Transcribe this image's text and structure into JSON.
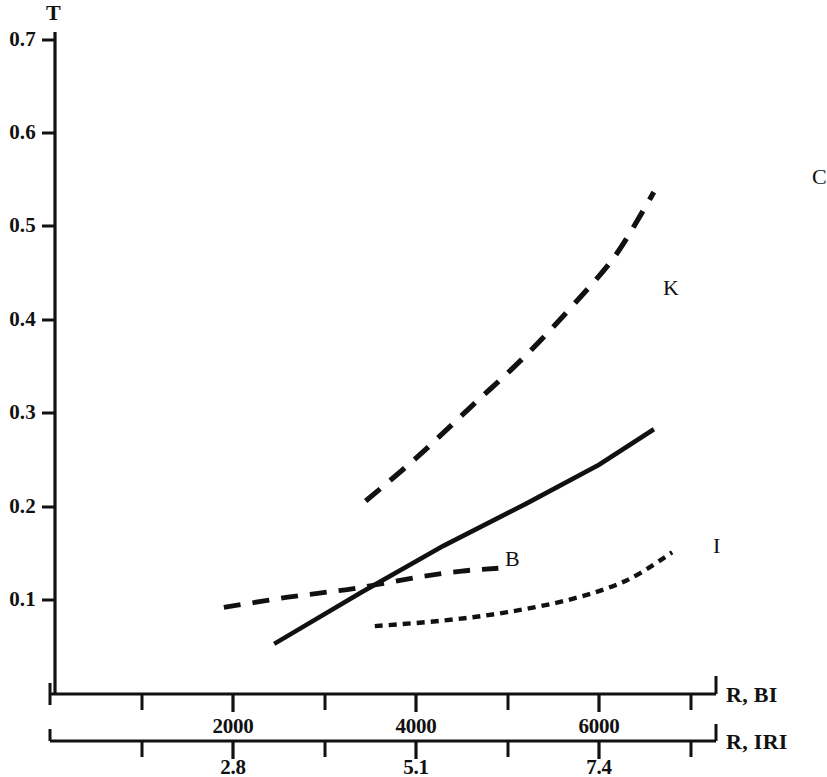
{
  "chart_data": {
    "type": "line",
    "title": "",
    "ylabel": "T",
    "ylim": [
      0,
      0.7
    ],
    "yticks": [
      0.1,
      0.2,
      0.3,
      0.4,
      0.5,
      0.6,
      0.7
    ],
    "ytick_labels": [
      "0.1",
      "0.2",
      "0.3",
      "0.4",
      "0.5",
      "0.6",
      "0.7"
    ],
    "grid": false,
    "legend": "inline-end-labels",
    "axes": [
      {
        "name": "primary-x-axis",
        "label": "R, BI",
        "ticks": [
          2000,
          4000,
          6000
        ],
        "tick_labels": [
          "2000",
          "4000",
          "6000"
        ],
        "minor_ticks": [
          1000,
          3000,
          5000,
          7000
        ],
        "xlim": [
          0,
          7600
        ]
      },
      {
        "name": "secondary-x-axis",
        "label": "R, IRI",
        "ticks": [
          2.8,
          5.1,
          7.4
        ],
        "tick_labels": [
          "2.8",
          "5.1",
          "7.4"
        ],
        "minor_ticks": [
          1.65,
          3.95,
          6.25,
          8.55
        ],
        "xlim": [
          0,
          8.9
        ]
      }
    ],
    "series": [
      {
        "name": "C",
        "label": "C",
        "style": "dashed",
        "points": [
          {
            "x": 3450,
            "y": 0.206
          },
          {
            "x": 4000,
            "y": 0.252
          },
          {
            "x": 4600,
            "y": 0.307
          },
          {
            "x": 5200,
            "y": 0.362
          },
          {
            "x": 5800,
            "y": 0.425
          },
          {
            "x": 6200,
            "y": 0.472
          },
          {
            "x": 6600,
            "y": 0.537
          }
        ]
      },
      {
        "name": "K",
        "label": "K",
        "style": "solid",
        "points": [
          {
            "x": 2450,
            "y": 0.053
          },
          {
            "x": 3400,
            "y": 0.108
          },
          {
            "x": 4300,
            "y": 0.158
          },
          {
            "x": 5200,
            "y": 0.203
          },
          {
            "x": 6000,
            "y": 0.245
          },
          {
            "x": 6600,
            "y": 0.283
          }
        ]
      },
      {
        "name": "B",
        "label": "B",
        "style": "dashed",
        "points": [
          {
            "x": 1900,
            "y": 0.092
          },
          {
            "x": 2600,
            "y": 0.103
          },
          {
            "x": 3300,
            "y": 0.112
          },
          {
            "x": 4000,
            "y": 0.124
          },
          {
            "x": 4500,
            "y": 0.131
          },
          {
            "x": 4900,
            "y": 0.134
          }
        ]
      },
      {
        "name": "I",
        "label": "I",
        "style": "dotted",
        "points": [
          {
            "x": 3550,
            "y": 0.072
          },
          {
            "x": 4300,
            "y": 0.078
          },
          {
            "x": 5000,
            "y": 0.087
          },
          {
            "x": 5700,
            "y": 0.101
          },
          {
            "x": 6300,
            "y": 0.121
          },
          {
            "x": 6800,
            "y": 0.151
          }
        ]
      }
    ],
    "colors": {
      "axis": "#111111",
      "series": "#111111",
      "background": "#ffffff"
    }
  },
  "labels": {
    "y_axis_title": "T",
    "y_ticks": [
      "0.7",
      "0.6",
      "0.5",
      "0.4",
      "0.3",
      "0.2",
      "0.1"
    ],
    "x_bi_ticks": [
      "2000",
      "4000",
      "6000"
    ],
    "x_bi_title": "R, BI",
    "x_iri_ticks": [
      "2.8",
      "5.1",
      "7.4"
    ],
    "x_iri_title": "R, IRI",
    "series": {
      "c": "C",
      "k": "K",
      "b": "B",
      "i": "I"
    }
  }
}
